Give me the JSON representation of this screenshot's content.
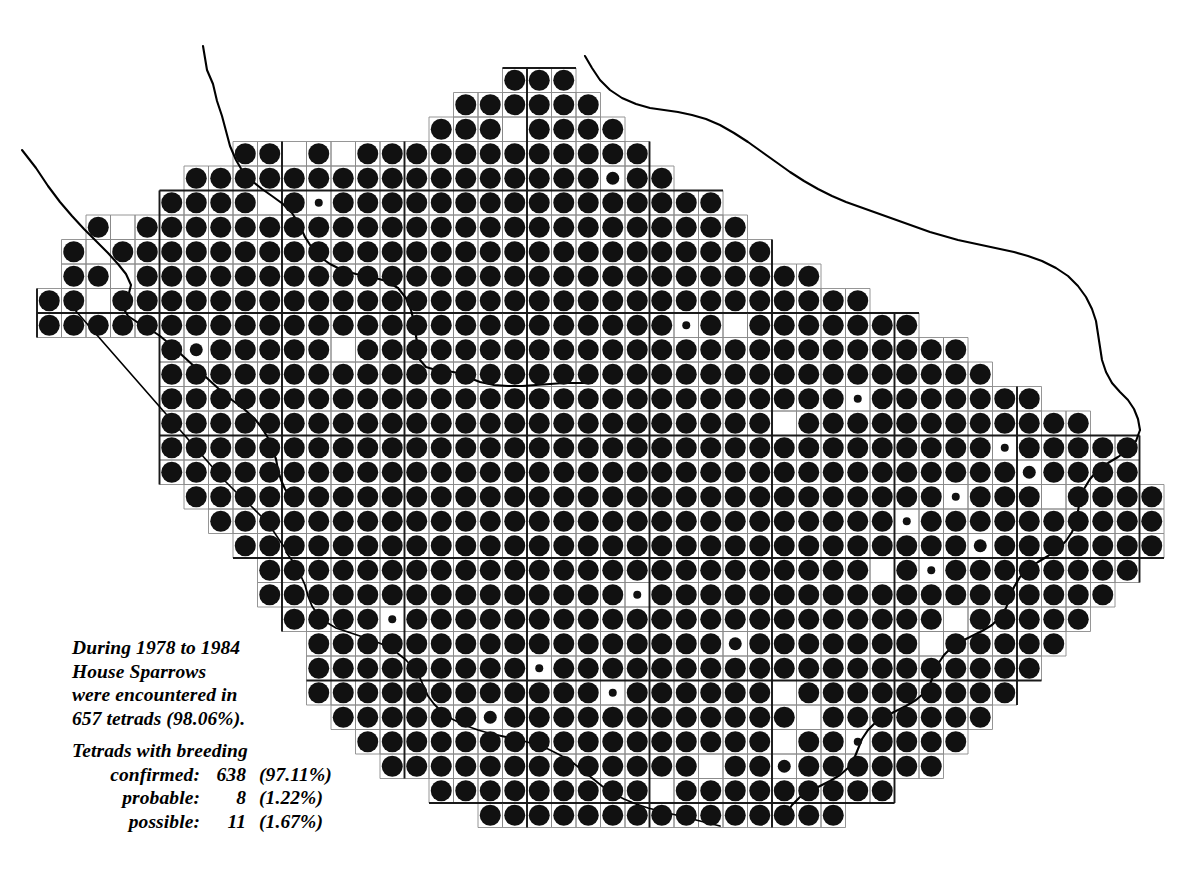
{
  "map": {
    "title": "House Sparrow tetrad distribution map",
    "region": "Cheshire and Wirral",
    "background_color": "#ffffff",
    "dot_color": "#111111",
    "grid_line_color": "#8a8a8a",
    "grid_line_major_color": "#1a1a1a",
    "coastline_color": "#000000",
    "grid": {
      "cell_size_px": 24.5,
      "origin_x_px": 37,
      "origin_y_px": 68,
      "cols": 46,
      "rows": 31,
      "major_every": 5
    },
    "dot_sizes": {
      "confirmed_diameter_px": 21,
      "probable_diameter_px": 13,
      "possible_diameter_px": 8
    }
  },
  "legend": {
    "paragraph1": [
      "During 1978 to 1984",
      "House Sparrows",
      "were encountered in",
      "657 tetrads (98.06%)."
    ],
    "heading": "Tetrads with breeding",
    "rows": [
      {
        "label": "confirmed:",
        "count": "638",
        "percent": "(97.11%)"
      },
      {
        "label": "probable:",
        "count": "8",
        "percent": "(1.22%)"
      },
      {
        "label": "possible:",
        "count": "11",
        "percent": "(1.67%)"
      }
    ],
    "years_from": "1978",
    "years_to": "1984",
    "species": "House Sparrows",
    "total_tetrads": "657",
    "total_percent": "98.06%"
  },
  "chart_data": {
    "type": "map",
    "categories": [
      "confirmed",
      "probable",
      "possible"
    ],
    "values": [
      638,
      8,
      11
    ],
    "percentages": [
      97.11,
      1.22,
      1.67
    ],
    "total_occupied_tetrads": 657,
    "total_occupied_percent": 98.06,
    "legend_position": "bottom-left",
    "grid": true
  },
  "tetrads": {
    "comment": "Per-row occupancy. Each entry: [row_index, start_col, list of dot codes]. 3=confirmed(large) 2=probable(mid) 1=possible(small) 0=empty cell present but unoccupied, -=no cell.",
    "rows": [
      {
        "r": 0,
        "c": 5,
        "d": "333"
      },
      {
        "r": 1,
        "c": 3,
        "d": "33333"
      },
      {
        "r": 2,
        "c": 2,
        "d": "3333333"
      },
      {
        "r": 3,
        "c": 0,
        "d": "-0333333330---333333333"
      },
      {
        "r": 4,
        "c": 0,
        "d": "333333333333"
      },
      {
        "r": 5,
        "c": 0,
        "d": "3333333333333"
      },
      {
        "r": 6,
        "c": 0,
        "d": "33333333333333"
      }
    ]
  }
}
